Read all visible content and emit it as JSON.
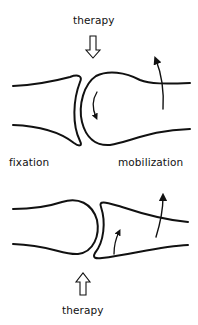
{
  "diagram": {
    "labels": {
      "therapy_top": "therapy",
      "therapy_bottom": "therapy",
      "fixation": "fixation",
      "mobilization": "mobilization"
    },
    "elements": [
      {
        "id": "top-joint",
        "description": "fixed concave bone (left) and convex mobilized bone head (right), therapy force pushing down"
      },
      {
        "id": "bottom-joint",
        "description": "fixed convex bone (left) and concave mobilized bone (right), therapy force pushing up"
      }
    ],
    "colors": {
      "stroke": "#111111",
      "background": "#ffffff"
    }
  }
}
